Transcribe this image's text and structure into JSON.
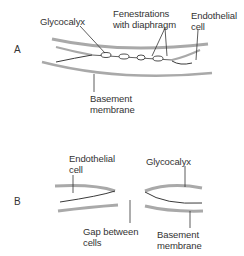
{
  "panels": [
    {
      "id": "A",
      "label": "A",
      "annotations": {
        "glycocalyx": "Glycocalyx",
        "fenestrations_line1": "Fenestrations",
        "fenestrations_line2": "with diaphragm",
        "endothelial_line1": "Endothelial",
        "endothelial_line2": "cell",
        "basement_line1": "Basement",
        "basement_line2": "membrane"
      }
    },
    {
      "id": "B",
      "label": "B",
      "annotations": {
        "endothelial_line1": "Endothelial",
        "endothelial_line2": "cell",
        "glycocalyx": "Glycocalyx",
        "gap_line1": "Gap between",
        "gap_line2": "cells",
        "basement_line1": "Basement",
        "basement_line2": "membrane"
      }
    }
  ],
  "colors": {
    "membrane": "#a9a9a9",
    "cell_outline": "#3a3a3a",
    "leader_line": "#333333",
    "text": "#333333"
  }
}
